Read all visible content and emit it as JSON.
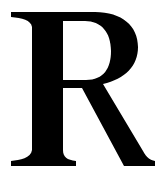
{
  "glyph": {
    "character": "R",
    "color": "#000000",
    "background": "#ffffff",
    "style": "serif"
  }
}
